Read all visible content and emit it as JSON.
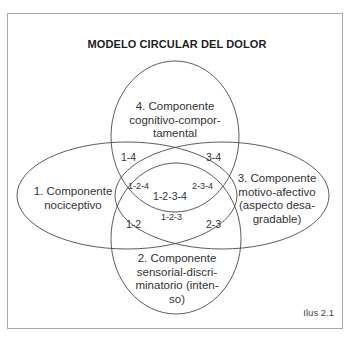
{
  "diagram": {
    "title": "MODELO CIRCULAR DEL DOLOR",
    "caption": "Ilus 2.1",
    "components": [
      {
        "id": "1",
        "lines": [
          "1. Componente",
          "nociceptivo"
        ]
      },
      {
        "id": "2",
        "lines": [
          "2. Componente",
          "sensorial-discri-",
          "minatorio (inten-",
          "so)"
        ]
      },
      {
        "id": "3",
        "lines": [
          "3. Componente",
          "motivo-afectivo",
          "(aspecto desa-",
          "gradable)"
        ]
      },
      {
        "id": "4",
        "lines": [
          "4. Componente",
          "cognitivo-compor-",
          "tamental"
        ]
      }
    ],
    "intersections": {
      "r14": "1-4",
      "r34": "3-4",
      "r124": "1-2-4",
      "r1234": "1-2-3-4",
      "r234": "2-3-4",
      "r123": "1-2-3",
      "r12": "1-2",
      "r23": "2-3"
    },
    "colors": {
      "stroke": "#4a4a4a",
      "frame": "#a8a8a8",
      "text": "#333333"
    }
  }
}
